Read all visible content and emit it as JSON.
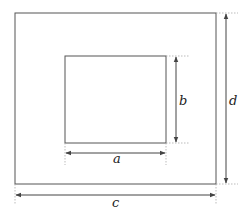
{
  "diagram": {
    "title": "",
    "outer_rect": {
      "x": 15,
      "y": 13,
      "w": 201,
      "h": 171
    },
    "inner_rect": {
      "x": 65,
      "y": 56,
      "w": 101,
      "h": 87
    },
    "labels": {
      "a": "a",
      "b": "b",
      "c": "c",
      "d": "d"
    },
    "colors": {
      "stroke": "#555555",
      "dotted": "#aaaaaa"
    }
  }
}
